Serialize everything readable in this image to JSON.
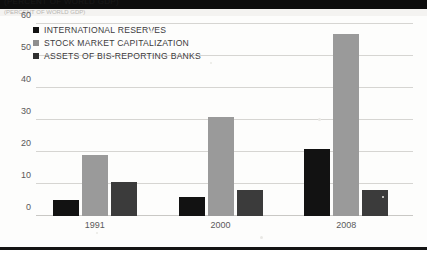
{
  "figure": {
    "top_cut_text": "(PERCENT OF WORLD GDP)",
    "caption_partial": "(PERCENT OF WORLD GDP)"
  },
  "legend": {
    "position": "top-left-inside-plot",
    "items": [
      {
        "label": "INTERNATIONAL RESERVES",
        "color": "#121212"
      },
      {
        "label": "STOCK MARKET CAPITALIZATION",
        "color": "#8e8e8e"
      },
      {
        "label": "ASSETS OF BIS-REPORTING BANKS",
        "color": "#2f2f2f"
      }
    ]
  },
  "chart_data": {
    "type": "bar",
    "title": "",
    "subtitle": "",
    "xlabel": "",
    "ylabel": "",
    "categories": [
      "1991",
      "2000",
      "2008"
    ],
    "series": [
      {
        "name": "INTERNATIONAL RESERVES",
        "color": "#121212",
        "values": [
          5,
          6,
          21
        ]
      },
      {
        "name": "STOCK MARKET CAPITALIZATION",
        "color": "#9a9a9a",
        "values": [
          19,
          31,
          57
        ]
      },
      {
        "name": "ASSETS OF BIS-REPORTING BANKS",
        "color": "#3b3b3b",
        "values": [
          10.5,
          8,
          8
        ]
      }
    ],
    "ylim": [
      0,
      60
    ],
    "yticks": [
      0,
      10,
      20,
      30,
      40,
      50,
      60
    ],
    "ytick_labels": [
      "0",
      "10",
      "20",
      "30",
      "40",
      "50",
      "60"
    ],
    "grid": true,
    "legend_position": "upper left"
  }
}
